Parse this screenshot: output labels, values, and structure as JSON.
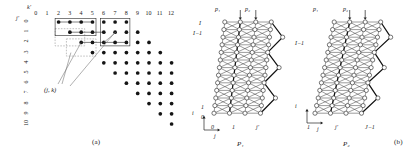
{
  "figure": {
    "panels": [
      {
        "id": "a",
        "caption": "(a)"
      },
      {
        "id": "b",
        "caption": "(b)"
      }
    ]
  },
  "panel_a": {
    "caption": "(a)",
    "axis_top_label": "k'",
    "axis_left_label": "j'",
    "col_ticks": [
      "0",
      "1",
      "2",
      "3",
      "4",
      "5",
      "6",
      "7",
      "8",
      "9",
      "10",
      "11",
      "12"
    ],
    "row_ticks": [
      "0",
      "1",
      "2",
      "3",
      "4",
      "5",
      "6",
      "7",
      "8",
      "9",
      "10"
    ],
    "annotation": "(j, k)",
    "lattice_rows": [
      {
        "row": 0,
        "cols": [
          2,
          3,
          4,
          5,
          6,
          7,
          8
        ]
      },
      {
        "row": 1,
        "cols": [
          3,
          4,
          5,
          6,
          7,
          8,
          9
        ]
      },
      {
        "row": 2,
        "cols": [
          4,
          5,
          6,
          7,
          8,
          9,
          10
        ]
      },
      {
        "row": 3,
        "cols": [
          5,
          6,
          7,
          8,
          9,
          10,
          11
        ]
      },
      {
        "row": 4,
        "cols": [
          6,
          7,
          8,
          9,
          10,
          11,
          12
        ]
      },
      {
        "row": 5,
        "cols": [
          7,
          8,
          9,
          10,
          11,
          12
        ]
      },
      {
        "row": 6,
        "cols": [
          8,
          9,
          10,
          11,
          12
        ]
      },
      {
        "row": 7,
        "cols": [
          9,
          10,
          11,
          12
        ]
      },
      {
        "row": 8,
        "cols": [
          10,
          11,
          12
        ]
      },
      {
        "row": 9,
        "cols": [
          11,
          12
        ]
      },
      {
        "row": 10,
        "cols": [
          12
        ]
      }
    ],
    "solid_boxes": [
      {
        "c0": 2,
        "r0": 0,
        "c1": 5,
        "r1": 1
      },
      {
        "c0": 6,
        "r0": 0,
        "c1": 8,
        "r1": 2
      }
    ],
    "dashed_boxes": [
      {
        "c0": 2,
        "r0": 1,
        "c1": 4,
        "r1": 2
      },
      {
        "c0": 3,
        "r0": 2,
        "c1": 5,
        "r1": 3
      }
    ]
  },
  "panel_b": {
    "caption": "(b)",
    "arrays": [
      {
        "name": "P1",
        "bottom_label": "P₁",
        "top_labels": [
          "p₁",
          "p₂"
        ],
        "left_labels": [
          "I",
          "I−1",
          "1",
          "0"
        ],
        "bottom_labels": [
          "0",
          "1",
          "j'"
        ],
        "axis_i": "i",
        "axis_j": "j",
        "rows": 13,
        "cols": 4,
        "diagonal_chains": 3
      },
      {
        "name": "P2",
        "bottom_label": "P₂",
        "top_labels": [
          "p₁",
          "p₂"
        ],
        "left_labels": [
          "I−1"
        ],
        "bottom_labels": [
          "1",
          "j'",
          "J−1"
        ],
        "axis_i": "i",
        "axis_j": "j",
        "rows": 13,
        "cols": 4,
        "diagonal_chains": 3
      }
    ]
  },
  "colors": {
    "dot": "#151515",
    "node_fill": "#ffffff",
    "node_stroke": "#3a3a3a",
    "link": "#4a4a4a",
    "highlight": "#111111",
    "dashed": "#8e8e8e"
  }
}
